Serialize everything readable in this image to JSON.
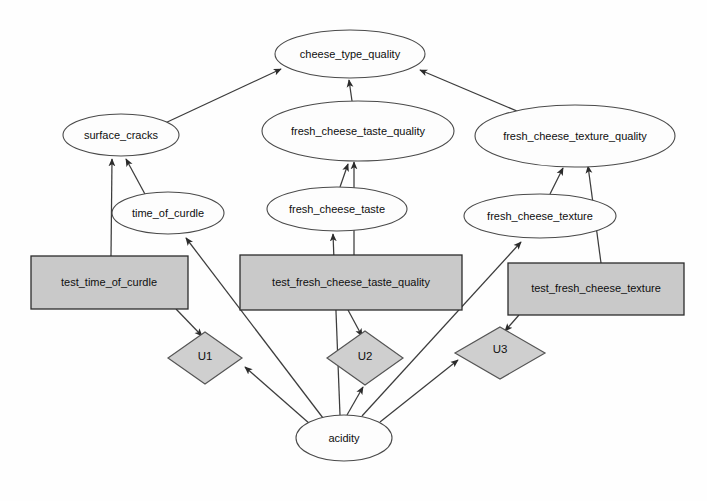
{
  "diagram": {
    "type": "causal-graph",
    "title": "",
    "background_color": "#fefefe",
    "node_fill_ellipse": "#fdfdfd",
    "node_fill_rect": "#c9c9c9",
    "node_fill_diamond": "#cfcfcf",
    "edge_color": "#3c3c3c",
    "nodes": [
      {
        "id": "cheese_type_quality",
        "label": "cheese_type_quality",
        "shape": "ellipse",
        "cx": 350,
        "cy": 54,
        "rx": 75,
        "ry": 24
      },
      {
        "id": "surface_cracks",
        "label": "surface_cracks",
        "shape": "ellipse",
        "cx": 121,
        "cy": 135,
        "rx": 58,
        "ry": 21
      },
      {
        "id": "fresh_cheese_taste_quality",
        "label": "fresh_cheese_taste_quality",
        "shape": "ellipse",
        "cx": 358,
        "cy": 131,
        "rx": 96,
        "ry": 30
      },
      {
        "id": "fresh_cheese_texture_quality",
        "label": "fresh_cheese_texture_quality",
        "shape": "ellipse",
        "cx": 575,
        "cy": 136,
        "rx": 100,
        "ry": 31
      },
      {
        "id": "time_of_curdle",
        "label": "time_of_curdle",
        "shape": "ellipse",
        "cx": 168,
        "cy": 213,
        "rx": 56,
        "ry": 21
      },
      {
        "id": "fresh_cheese_taste",
        "label": "fresh_cheese_taste",
        "shape": "ellipse",
        "cx": 337,
        "cy": 209,
        "rx": 70,
        "ry": 22
      },
      {
        "id": "fresh_cheese_texture",
        "label": "fresh_cheese_texture",
        "shape": "ellipse",
        "cx": 540,
        "cy": 216,
        "rx": 76,
        "ry": 22
      },
      {
        "id": "test_time_of_curdle",
        "label": "test_time_of_curdle",
        "shape": "rect",
        "x": 31,
        "y": 256,
        "w": 157,
        "h": 53
      },
      {
        "id": "test_fresh_cheese_taste_quality",
        "label": "test_fresh_cheese_taste_quality",
        "shape": "rect",
        "x": 240,
        "y": 255,
        "w": 222,
        "h": 55
      },
      {
        "id": "test_fresh_cheese_texture",
        "label": "test_fresh_cheese_texture",
        "shape": "rect",
        "x": 508,
        "y": 263,
        "w": 176,
        "h": 52
      },
      {
        "id": "U1",
        "label": "U1",
        "shape": "diamond",
        "cx": 205,
        "cy": 358,
        "rx": 37,
        "ry": 26
      },
      {
        "id": "U2",
        "label": "U2",
        "shape": "diamond",
        "cx": 365,
        "cy": 358,
        "rx": 38,
        "ry": 27
      },
      {
        "id": "U3",
        "label": "U3",
        "shape": "diamond",
        "cx": 500,
        "cy": 353,
        "rx": 45,
        "ry": 26
      },
      {
        "id": "acidity",
        "label": "acidity",
        "shape": "ellipse",
        "cx": 344,
        "cy": 438,
        "rx": 48,
        "ry": 23
      }
    ],
    "edges": [
      {
        "from": "surface_cracks",
        "to": "cheese_type_quality"
      },
      {
        "from": "fresh_cheese_taste_quality",
        "to": "cheese_type_quality"
      },
      {
        "from": "fresh_cheese_texture_quality",
        "to": "cheese_type_quality"
      },
      {
        "from": "time_of_curdle",
        "to": "surface_cracks"
      },
      {
        "from": "test_time_of_curdle",
        "to": "surface_cracks"
      },
      {
        "from": "fresh_cheese_taste",
        "to": "fresh_cheese_taste_quality"
      },
      {
        "from": "test_fresh_cheese_taste_quality",
        "to": "fresh_cheese_taste_quality"
      },
      {
        "from": "fresh_cheese_texture",
        "to": "fresh_cheese_texture_quality"
      },
      {
        "from": "test_fresh_cheese_texture",
        "to": "fresh_cheese_texture_quality"
      },
      {
        "from": "test_time_of_curdle",
        "to": "U1"
      },
      {
        "from": "test_fresh_cheese_taste_quality",
        "to": "U2"
      },
      {
        "from": "test_fresh_cheese_texture",
        "to": "U3"
      },
      {
        "from": "acidity",
        "to": "U1"
      },
      {
        "from": "acidity",
        "to": "U2"
      },
      {
        "from": "acidity",
        "to": "U3"
      },
      {
        "from": "acidity",
        "to": "time_of_curdle"
      },
      {
        "from": "acidity",
        "to": "fresh_cheese_taste"
      },
      {
        "from": "acidity",
        "to": "fresh_cheese_texture"
      }
    ]
  }
}
